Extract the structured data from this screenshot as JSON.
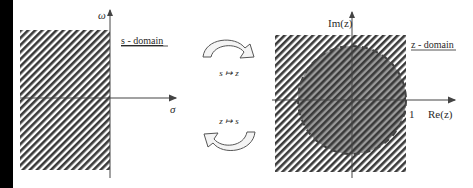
{
  "s_domain": {
    "title": "s - domain",
    "vertical_axis_label": "ω",
    "horizontal_axis_label": "σ",
    "stable_region": "left half-plane (hatched)"
  },
  "mappings": {
    "forward_label": "s ↦ z",
    "inverse_label": "z ↦ s"
  },
  "z_domain": {
    "title": "z - domain",
    "vertical_axis_label": "Im(z)",
    "horizontal_axis_label": "Re(z)",
    "unit_marker": "1",
    "stable_region": "unit circle interior (dashed boundary)"
  },
  "colors": {
    "hatch": "#3a3a3a",
    "circle_fill": "#8a8a8a",
    "axis": "#444444",
    "left_bar": "#000000"
  }
}
